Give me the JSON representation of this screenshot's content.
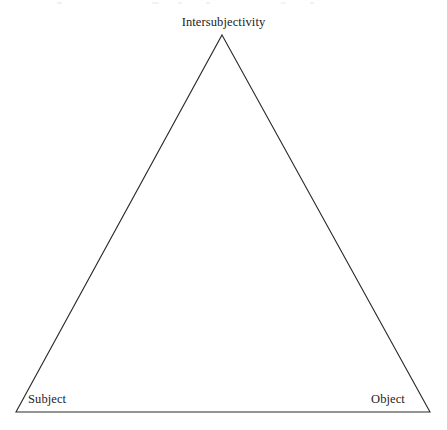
{
  "diagram": {
    "type": "triangle-diagram",
    "canvas": {
      "width": 447,
      "height": 430
    },
    "background_color": "#ffffff",
    "stroke_color": "#2a2a2a",
    "stroke_width": 1,
    "text_color": "#232323",
    "fill": "none",
    "vertices": [
      {
        "id": "apex",
        "label": "Intersubjectivity",
        "x": 222,
        "y": 35
      },
      {
        "id": "bottom-left",
        "label": "Subject",
        "x": 16,
        "y": 412
      },
      {
        "id": "bottom-right",
        "label": "Object",
        "x": 430,
        "y": 412
      }
    ],
    "edges": [
      {
        "from": "bottom-left",
        "to": "apex"
      },
      {
        "from": "apex",
        "to": "bottom-right"
      },
      {
        "from": "bottom-right",
        "to": "bottom-left"
      }
    ],
    "labels": {
      "apex": "Intersubjectivity",
      "bottom_left": "Subject",
      "bottom_right": "Object"
    }
  }
}
